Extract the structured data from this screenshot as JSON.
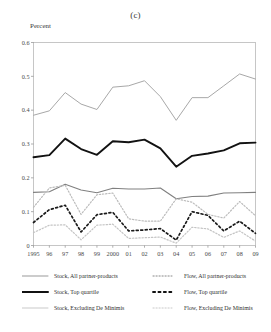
{
  "panel": {
    "title": "(c)",
    "y_axis_title": "Percent"
  },
  "legend": {
    "left_items": [
      {
        "label": "Stock,  All partner-products",
        "style": "solid",
        "color": "#999999",
        "width": 1.0,
        "name": "stock-all-partner-products"
      },
      {
        "label": "Stock,  Top quartile",
        "style": "solid",
        "color": "#111111",
        "width": 2.0,
        "name": "stock-top-quartile"
      },
      {
        "label": "Stock,  Excluding De Minimis",
        "style": "solid",
        "color": "#c9c9c9",
        "width": 1.0,
        "name": "stock-excluding-de-minimis"
      }
    ],
    "right_items": [
      {
        "label": "Flow,  All partner-products",
        "style": "dotted",
        "color": "#888888",
        "width": 1.0,
        "name": "flow-all-partner-products"
      },
      {
        "label": "Flow,  Top quartile",
        "style": "dotted",
        "color": "#111111",
        "width": 1.8,
        "name": "flow-top-quartile"
      },
      {
        "label": "Flow,  Excluding De Minimis",
        "style": "dotted",
        "color": "#c9c9c9",
        "width": 1.0,
        "name": "flow-excluding-de-minimis"
      }
    ]
  },
  "chart_data": {
    "type": "line",
    "title": "(c)",
    "xlabel": "",
    "ylabel": "Percent",
    "ylim": [
      0,
      0.6
    ],
    "ytick_values": [
      0,
      0.1,
      0.2,
      0.3,
      0.4,
      0.5,
      0.6
    ],
    "ytick_labels": [
      "0",
      "0.1",
      "0.2",
      "0.3",
      "0.4",
      "0.5",
      "0.6"
    ],
    "grid": false,
    "legend_position": "below",
    "x": [
      1995,
      1996,
      1997,
      1998,
      1999,
      2000,
      2001,
      2002,
      2003,
      2004,
      2005,
      2006,
      2007,
      2008,
      2009
    ],
    "xtick_labels": [
      "1995",
      "96",
      "97",
      "98",
      "99",
      "2000",
      "01",
      "02",
      "03",
      "04",
      "05",
      "06",
      "07",
      "08",
      "09"
    ],
    "series": [
      {
        "name": "Stock,  All partner-products",
        "style": "solid",
        "color": "#a8a8a8",
        "width": 1.0,
        "values": [
          0.385,
          0.398,
          0.452,
          0.418,
          0.402,
          0.468,
          0.472,
          0.487,
          0.44,
          0.37,
          0.437,
          0.437,
          0.472,
          0.507,
          0.492
        ]
      },
      {
        "name": "Stock,  Top quartile",
        "style": "solid",
        "color": "#121212",
        "width": 1.9,
        "values": [
          0.261,
          0.267,
          0.316,
          0.285,
          0.268,
          0.308,
          0.305,
          0.313,
          0.287,
          0.233,
          0.265,
          0.272,
          0.281,
          0.302,
          0.304
        ]
      },
      {
        "name": "Stock,  Excluding De Minimis",
        "style": "solid",
        "color": "#808080",
        "width": 1.1,
        "values": [
          0.157,
          0.159,
          0.181,
          0.164,
          0.156,
          0.169,
          0.167,
          0.167,
          0.17,
          0.138,
          0.145,
          0.146,
          0.155,
          0.156,
          0.157
        ]
      },
      {
        "name": "Flow,  All partner-products",
        "style": "dotted",
        "color": "#bcbcbc",
        "width": 1.2,
        "values": [
          0.113,
          0.17,
          0.178,
          0.092,
          0.15,
          0.155,
          0.079,
          0.072,
          0.072,
          0.138,
          0.128,
          0.092,
          0.081,
          0.13,
          0.088
        ]
      },
      {
        "name": "Flow,  Top quartile",
        "style": "dotted",
        "color": "#1a1a1a",
        "width": 1.7,
        "values": [
          0.068,
          0.106,
          0.119,
          0.04,
          0.091,
          0.098,
          0.043,
          0.046,
          0.05,
          0.016,
          0.1,
          0.089,
          0.043,
          0.072,
          0.036
        ]
      },
      {
        "name": "Flow,  Excluding De Minimis",
        "style": "dotted",
        "color": "#c4c4c4",
        "width": 1.2,
        "values": [
          0.038,
          0.06,
          0.061,
          0.017,
          0.06,
          0.063,
          0.021,
          0.023,
          0.025,
          0.007,
          0.054,
          0.049,
          0.024,
          0.043,
          0.013
        ]
      }
    ]
  }
}
